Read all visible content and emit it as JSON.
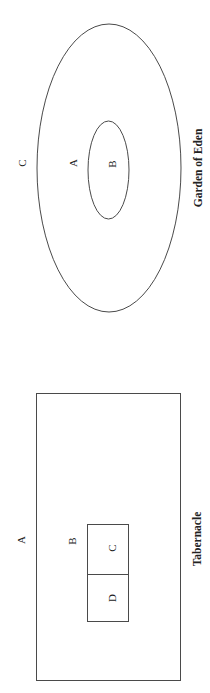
{
  "diagrams": [
    {
      "caption": "Garden of Eden",
      "shape": "nested-ellipses",
      "labels": {
        "outer_outside": "C",
        "outer_inside": "A",
        "inner": "B"
      }
    },
    {
      "caption": "Tabernacle",
      "shape": "nested-rectangles",
      "labels": {
        "outer_outside": "A",
        "outer_inside": "B",
        "inner_first": "C",
        "inner_second": "D"
      }
    }
  ],
  "colors": {
    "stroke": "#4a4a4a",
    "text": "#222222",
    "background": "#ffffff"
  }
}
